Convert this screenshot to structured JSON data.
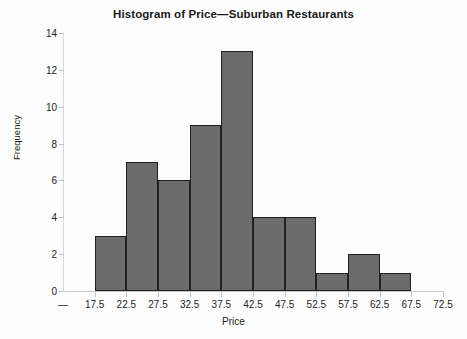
{
  "chart_data": {
    "type": "bar",
    "title": "Histogram of Price—Suburban Restaurants",
    "xlabel": "Price",
    "ylabel": "Frequency",
    "categories": [
      "17.5-22.5",
      "22.5-27.5",
      "27.5-32.5",
      "32.5-37.5",
      "37.5-42.5",
      "42.5-47.5",
      "47.5-52.5",
      "52.5-57.5",
      "57.5-62.5",
      "62.5-67.5",
      "67.5-72.5"
    ],
    "bin_starts": [
      17.5,
      22.5,
      27.5,
      32.5,
      37.5,
      42.5,
      47.5,
      52.5,
      57.5,
      62.5,
      67.5
    ],
    "bin_width": 5,
    "values": [
      3,
      7,
      6,
      9,
      13,
      4,
      4,
      1,
      2,
      1,
      0
    ],
    "bars": [
      {
        "bin_start": 17.5,
        "bin_end": 22.5,
        "frequency": 3
      },
      {
        "bin_start": 22.5,
        "bin_end": 27.5,
        "frequency": 7
      },
      {
        "bin_start": 27.5,
        "bin_end": 32.5,
        "frequency": 6
      },
      {
        "bin_start": 32.5,
        "bin_end": 37.5,
        "frequency": 9
      },
      {
        "bin_start": 37.5,
        "bin_end": 42.5,
        "frequency": 13
      },
      {
        "bin_start": 42.5,
        "bin_end": 47.5,
        "frequency": 4
      },
      {
        "bin_start": 47.5,
        "bin_end": 52.5,
        "frequency": 4
      },
      {
        "bin_start": 52.5,
        "bin_end": 57.5,
        "frequency": 1
      },
      {
        "bin_start": 57.5,
        "bin_end": 62.5,
        "frequency": 2
      },
      {
        "bin_start": 62.5,
        "bin_end": 67.5,
        "frequency": 1
      }
    ],
    "ylim": [
      0,
      14
    ],
    "yticks": [
      0,
      2,
      4,
      6,
      8,
      10,
      12,
      14
    ],
    "ytick_labels": [
      "0",
      "2",
      "4",
      "6",
      "8",
      "10",
      "12",
      "14"
    ],
    "xtick_labels": [
      "—",
      "17.5",
      "22.5",
      "27.5",
      "32.5",
      "37.5",
      "42.5",
      "47.5",
      "52.5",
      "57.5",
      "62.5",
      "67.5",
      "72.5"
    ],
    "xlim": [
      12.5,
      72.5
    ],
    "grid": false,
    "legend": "none",
    "bar_fill_color": "#6b6b6b",
    "bar_edge_color": "#231f20",
    "background_color": "#fdfdfd"
  }
}
